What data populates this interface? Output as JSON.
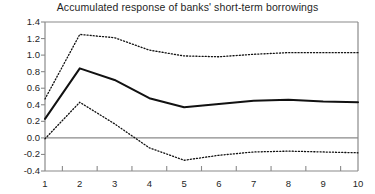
{
  "figure": {
    "title": "Accumulated response of banks' short-term borrowings",
    "background_color": "#ffffff",
    "axis_color": "#8a8a8a",
    "line_color": "#111111"
  },
  "chart_data": {
    "type": "line",
    "title": "Accumulated response of banks' short-term borrowings",
    "xlabel": "",
    "ylabel": "",
    "x": [
      1,
      2,
      3,
      4,
      5,
      6,
      7,
      8,
      9,
      10
    ],
    "xlim": [
      1,
      10
    ],
    "ylim": [
      -0.4,
      1.4
    ],
    "xticks": [
      "1",
      "2",
      "3",
      "4",
      "5",
      "6",
      "7",
      "8",
      "9",
      "10"
    ],
    "yticks": [
      "1.4",
      "1.2",
      "1.0",
      "0.8",
      "0.6",
      "0.4",
      "0.2",
      "0.0",
      "-0.2",
      "-0.4"
    ],
    "ytick_values": [
      1.4,
      1.2,
      1.0,
      0.8,
      0.6,
      0.4,
      0.2,
      0.0,
      -0.2,
      -0.4
    ],
    "grid": false,
    "gridlines_y": [
      1.4,
      0.0,
      -0.4
    ],
    "legend": "none",
    "legend_position": "none",
    "series": [
      {
        "name": "Accumulated response",
        "style": "solid",
        "values": [
          0.23,
          0.84,
          0.7,
          0.48,
          0.37,
          0.41,
          0.45,
          0.46,
          0.44,
          0.43
        ]
      },
      {
        "name": "Upper confidence band",
        "style": "dotted",
        "values": [
          0.47,
          1.25,
          1.21,
          1.06,
          0.99,
          0.98,
          1.01,
          1.03,
          1.03,
          1.03
        ]
      },
      {
        "name": "Lower confidence band",
        "style": "dotted",
        "values": [
          -0.01,
          0.43,
          0.17,
          -0.12,
          -0.27,
          -0.21,
          -0.17,
          -0.16,
          -0.17,
          -0.18
        ]
      }
    ]
  },
  "axes": {
    "x_start_px": 45,
    "x_end_px": 358,
    "y_top_value": 1.4,
    "y_top_px": 22,
    "y_bottom_value": -0.4,
    "y_bottom_px": 171
  }
}
